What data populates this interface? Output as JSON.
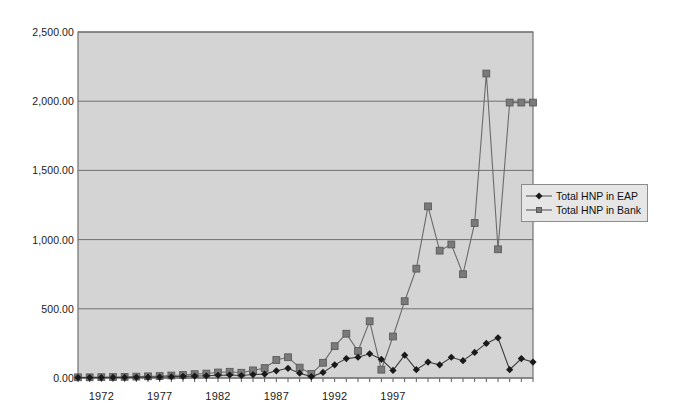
{
  "chart_data": {
    "type": "line",
    "title": "",
    "subtitle": "",
    "xlabel": "",
    "ylabel": "",
    "x": [
      1970,
      1971,
      1972,
      1973,
      1974,
      1975,
      1976,
      1977,
      1978,
      1979,
      1980,
      1981,
      1982,
      1983,
      1984,
      1985,
      1986,
      1987,
      1988,
      1989,
      1990,
      1991,
      1992,
      1993,
      1994,
      1995,
      1996,
      1997,
      1998,
      1999,
      2000,
      2001,
      2002,
      2003,
      2004,
      2005,
      2006,
      2007,
      2008,
      2009
    ],
    "xlim": [
      1970,
      2009
    ],
    "ylim": [
      0,
      2500
    ],
    "ytick_values": [
      0,
      500,
      1000,
      1500,
      2000,
      2500
    ],
    "ytick_labels": [
      "0.00",
      "500.00",
      "1,000.00",
      "1,500.00",
      "2,000.00",
      "2,500.00"
    ],
    "xtick_values": [
      1972,
      1977,
      1982,
      1987,
      1992,
      1997
    ],
    "xtick_labels": [
      "1972",
      "1977",
      "1982",
      "1987",
      "1992",
      "1997"
    ],
    "grid": "horizontal",
    "legend_position": "right",
    "plot_background": "#d4d4d4",
    "figure_background": "#ffffff",
    "series": [
      {
        "name": "Total HNP in EAP",
        "marker": "diamond",
        "color": "#1a1a1a",
        "line_color": "#3d3d3d",
        "values": [
          3,
          3,
          3,
          4,
          4,
          5,
          6,
          7,
          9,
          12,
          14,
          16,
          20,
          22,
          18,
          25,
          28,
          52,
          70,
          35,
          10,
          40,
          95,
          140,
          150,
          175,
          135,
          55,
          165,
          60,
          115,
          95,
          150,
          125,
          185,
          250,
          290,
          60,
          140,
          115
        ]
      },
      {
        "name": "Total HNP in Bank",
        "marker": "square",
        "color": "#7a7a7a",
        "line_color": "#6b6b6b",
        "values": [
          5,
          5,
          6,
          7,
          8,
          10,
          12,
          14,
          18,
          22,
          28,
          32,
          40,
          45,
          38,
          55,
          72,
          130,
          150,
          75,
          30,
          110,
          230,
          320,
          195,
          410,
          60,
          300,
          555,
          790,
          1240,
          920,
          965,
          750,
          1120,
          2200,
          930,
          1990,
          1990,
          1990
        ]
      }
    ]
  },
  "legend": {
    "items": [
      {
        "label": "Total HNP in EAP",
        "marker": "diamond"
      },
      {
        "label": "Total HNP in Bank",
        "marker": "square"
      }
    ]
  }
}
